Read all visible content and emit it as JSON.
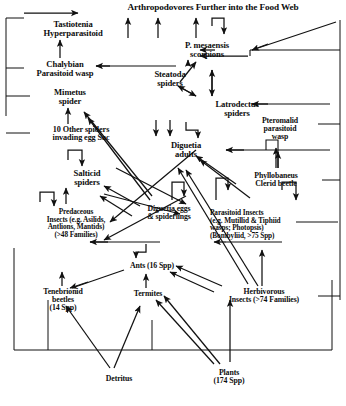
{
  "figure": {
    "title": "Arthropodovores Further into the Food Web",
    "type": "food-web-diagram",
    "background": "#ffffff",
    "ink": "#101010"
  },
  "nodes": [
    {
      "id": "arthropodovores",
      "label": "Arthropodovores Further into the Food Web",
      "x": 82,
      "y": 3,
      "w": 262,
      "size": "n-title",
      "trophic": "top-predators"
    },
    {
      "id": "tastiotenia",
      "label": "Tastiotenia\nHyperparasitoid",
      "x": 18,
      "y": 20,
      "w": 110,
      "size": "s9",
      "trophic": "hyperparasitoid"
    },
    {
      "id": "chalybian",
      "label": "Chalybian\nParasitoid wasp",
      "x": 6,
      "y": 60,
      "w": 118,
      "size": "s9",
      "trophic": "parasitoid"
    },
    {
      "id": "mimetus",
      "label": "Mimetus\nspider",
      "x": 32,
      "y": 88,
      "w": 76,
      "size": "s9",
      "trophic": "araneophagic-spider"
    },
    {
      "id": "other_spiders",
      "label": "10 Other spiders\ninvading egg Sac",
      "x": 22,
      "y": 126,
      "w": 118,
      "size": "s85",
      "trophic": "egg-sac-invaders"
    },
    {
      "id": "salticid",
      "label": "Salticid\nspiders",
      "x": 52,
      "y": 169,
      "w": 70,
      "size": "s9",
      "trophic": "spider"
    },
    {
      "id": "predaceous",
      "label": "Predaceous\nInsects (e.g. Asilids,\nAntlions, Mantids)\n(>48 Families)",
      "x": 14,
      "y": 208,
      "w": 124,
      "size": "s75",
      "trophic": "predaceous-insects"
    },
    {
      "id": "ants",
      "label": "Ants (16 Spp)",
      "x": 110,
      "y": 262,
      "w": 84,
      "size": "s8",
      "trophic": "omnivore"
    },
    {
      "id": "tenebrionid",
      "label": "Tenebrionid\nbeetles\n(14 Spp)",
      "x": 22,
      "y": 288,
      "w": 82,
      "size": "s8",
      "trophic": "detritivore"
    },
    {
      "id": "termites",
      "label": "Termites",
      "x": 117,
      "y": 290,
      "w": 62,
      "size": "s8",
      "trophic": "detritivore"
    },
    {
      "id": "herbivorous",
      "label": "Herbivorous\nInsects (>74 Families)",
      "x": 208,
      "y": 288,
      "w": 112,
      "size": "s8",
      "trophic": "herbivore"
    },
    {
      "id": "detritus",
      "label": "Detritus",
      "x": 88,
      "y": 375,
      "w": 62,
      "size": "s8",
      "trophic": "basal-resource"
    },
    {
      "id": "plants",
      "label": "Plants\n(174 Spp)",
      "x": 198,
      "y": 369,
      "w": 62,
      "size": "s8",
      "trophic": "basal-resource"
    },
    {
      "id": "pmesaensis",
      "label": "P. mesaensis\nscorpions",
      "x": 162,
      "y": 41,
      "w": 90,
      "size": "s9",
      "trophic": "scorpion"
    },
    {
      "id": "steatoda",
      "label": "Steatoda\nspiders",
      "x": 135,
      "y": 70,
      "w": 70,
      "size": "s9",
      "trophic": "spider"
    },
    {
      "id": "latrodectus",
      "label": "Latrodectus\nspiders",
      "x": 195,
      "y": 100,
      "w": 84,
      "size": "s9",
      "trophic": "spider"
    },
    {
      "id": "diguetia_adults",
      "label": "Diguetia\nadults",
      "x": 152,
      "y": 141,
      "w": 68,
      "size": "s9",
      "trophic": "spider"
    },
    {
      "id": "diguetia_eggs",
      "label": "Diguetia eggs\n& spiderlings",
      "x": 122,
      "y": 205,
      "w": 94,
      "size": "s8",
      "trophic": "spider-eggs"
    },
    {
      "id": "pteromalid",
      "label": "Pteromalid\nparasitoid\nwasp",
      "x": 240,
      "y": 117,
      "w": 80,
      "size": "s8",
      "trophic": "parasitoid"
    },
    {
      "id": "phyllobaneus",
      "label": "Phyllobaneus\nClerid beetle",
      "x": 229,
      "y": 172,
      "w": 94,
      "size": "s8",
      "trophic": "predator-beetle"
    },
    {
      "id": "parasitoid_insects",
      "label": "Parasitoid Insects\n(e.g. Mutillid & Tiphiid\nwasps; Photopsis)\n(Bombyliid, >75 Spp)",
      "x": 210,
      "y": 209,
      "w": 130,
      "size": "s75",
      "trophic": "parasitoid"
    }
  ],
  "edges": [
    {
      "from": "tastiotenia",
      "to": "arthropodovores"
    },
    {
      "from": "chalybian",
      "to": "tastiotenia"
    },
    {
      "from": "other_spiders",
      "to": "mimetus"
    },
    {
      "from": "salticid",
      "to": "salticid",
      "kind": "cannibalism"
    },
    {
      "from": "predaceous",
      "to": "salticid"
    },
    {
      "from": "predaceous",
      "to": "predaceous",
      "kind": "cannibalism"
    },
    {
      "from": "ants",
      "to": "predaceous"
    },
    {
      "from": "parasitoid_insects",
      "to": "predaceous"
    },
    {
      "from": "detritus",
      "to": "tenebrionid"
    },
    {
      "from": "detritus",
      "to": "termites"
    },
    {
      "from": "plants",
      "to": "termites"
    },
    {
      "from": "plants",
      "to": "herbivorous"
    },
    {
      "from": "termites",
      "to": "ants"
    },
    {
      "from": "tenebrionid",
      "to": "ants"
    },
    {
      "from": "herbivorous",
      "to": "ants"
    },
    {
      "from": "herbivorous",
      "to": "parasitoid_insects"
    },
    {
      "from": "herbivorous",
      "to": "diguetia_adults"
    },
    {
      "from": "diguetia_eggs",
      "to": "diguetia_adults"
    },
    {
      "from": "diguetia_adults",
      "to": "diguetia_eggs"
    },
    {
      "from": "diguetia_adults",
      "to": "latrodectus"
    },
    {
      "from": "diguetia_adults",
      "to": "steatoda"
    },
    {
      "from": "steatoda",
      "to": "pmesaensis"
    },
    {
      "from": "latrodectus",
      "to": "steatoda"
    },
    {
      "from": "steatoda",
      "to": "latrodectus"
    },
    {
      "from": "pmesaensis",
      "to": "arthropodovores"
    },
    {
      "from": "phyllobaneus",
      "to": "diguetia_adults"
    },
    {
      "from": "phyllobaneus",
      "to": "pteromalid"
    },
    {
      "from": "pteromalid",
      "to": "diguetia_eggs"
    },
    {
      "from": "mimetus",
      "to": "chalybian"
    },
    {
      "from": "diguetia_eggs",
      "to": "mimetus"
    },
    {
      "from": "diguetia_eggs",
      "to": "salticid"
    }
  ]
}
